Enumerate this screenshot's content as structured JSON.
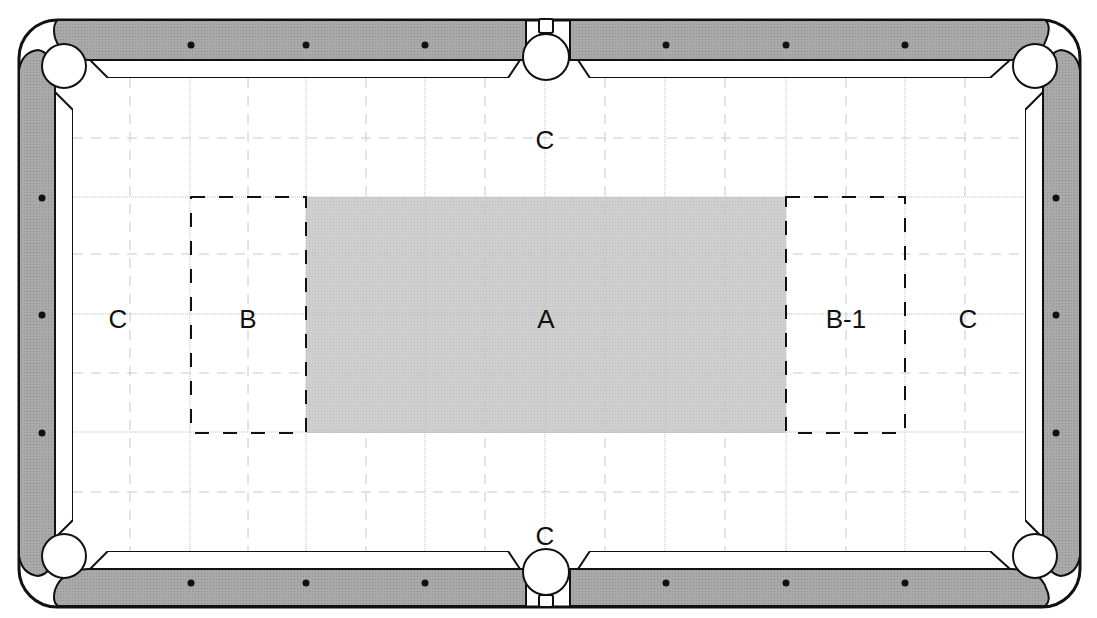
{
  "diagram": {
    "type": "pool-table-zones",
    "colors": {
      "rail": "#a9a9a9",
      "outline": "#111111",
      "cloth": "#ffffff",
      "zone_a_fill": "#cdcdcd",
      "grid_solid": "#bdbdbd",
      "grid_dashed": "#c8c8c8",
      "diamond": "#111111",
      "pocket": "#ffffff"
    },
    "zones": [
      {
        "id": "A",
        "label": "A",
        "shaded": true
      },
      {
        "id": "B",
        "label": "B",
        "boxed": true
      },
      {
        "id": "B-1",
        "label": "B-1",
        "boxed": true
      },
      {
        "id": "C-top",
        "label": "C"
      },
      {
        "id": "C-bottom",
        "label": "C"
      },
      {
        "id": "C-left",
        "label": "C"
      },
      {
        "id": "C-right",
        "label": "C"
      }
    ],
    "pockets": [
      "top-left",
      "top-middle",
      "top-right",
      "bottom-left",
      "bottom-middle",
      "bottom-right"
    ],
    "diamonds": {
      "top": 6,
      "bottom": 6,
      "left": 3,
      "right": 3
    }
  }
}
